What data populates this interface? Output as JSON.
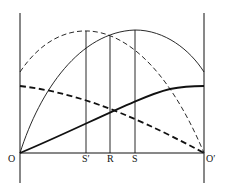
{
  "diagram": {
    "labels": {
      "origin_left": "O",
      "origin_right": "O′",
      "s_prime": "S′",
      "r": "R",
      "s": "S"
    },
    "curves": [
      {
        "name": "thin-dashed-parabola",
        "style": "dashed",
        "weight": "thin"
      },
      {
        "name": "thin-solid-parabola",
        "style": "solid",
        "weight": "thin"
      },
      {
        "name": "thick-dashed-curve",
        "style": "dashed",
        "weight": "thick"
      },
      {
        "name": "thick-solid-curve",
        "style": "solid",
        "weight": "thick"
      }
    ],
    "colors": {
      "ink": "#111111",
      "background": "#ffffff"
    }
  }
}
